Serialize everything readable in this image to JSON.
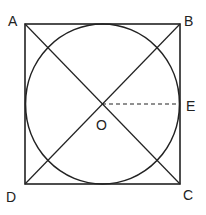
{
  "diagram": {
    "type": "geometry",
    "colors": {
      "stroke": "#222222",
      "background": "#ffffff"
    },
    "points": {
      "A": {
        "label": "A",
        "x": 25,
        "y": 24
      },
      "B": {
        "label": "B",
        "x": 180,
        "y": 24
      },
      "C": {
        "label": "C",
        "x": 180,
        "y": 184
      },
      "D": {
        "label": "D",
        "x": 25,
        "y": 184
      },
      "O": {
        "label": "O",
        "x": 102,
        "y": 104
      },
      "E": {
        "label": "E",
        "x": 180,
        "y": 104
      }
    },
    "shapes": {
      "square": [
        "A",
        "B",
        "C",
        "D"
      ],
      "circle": {
        "center": "O",
        "rx": 77,
        "ry": 80
      },
      "diagonals": [
        [
          "A",
          "C"
        ],
        [
          "B",
          "D"
        ]
      ],
      "dashed_segments": [
        [
          "O",
          "E"
        ]
      ]
    }
  }
}
